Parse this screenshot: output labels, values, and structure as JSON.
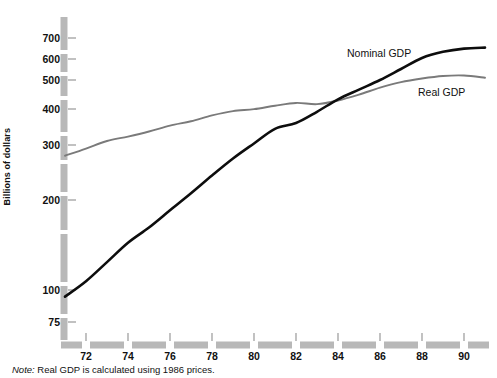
{
  "chart_data": {
    "type": "line",
    "title": "",
    "xlabel": "",
    "ylabel": "Billions of dollars",
    "note": "Note: Real GDP is calculated using 1986 prices.",
    "note_prefix": "Note:",
    "note_body": " Real GDP is calculated using 1986 prices.",
    "yscale": "log",
    "ylim": [
      75,
      760
    ],
    "xlim": [
      1971,
      1991
    ],
    "grid": false,
    "legend_position": "inline-annotation",
    "ytick_labels": [
      "700",
      "600",
      "500",
      "400",
      "300",
      "200",
      "100",
      "75"
    ],
    "ytick_values": [
      700,
      600,
      500,
      400,
      300,
      200,
      100,
      75
    ],
    "xtick_labels": [
      "72",
      "74",
      "76",
      "78",
      "80",
      "82",
      "84",
      "86",
      "88",
      "90"
    ],
    "xtick_values": [
      1972,
      1974,
      1976,
      1978,
      1980,
      1982,
      1984,
      1986,
      1988,
      1990
    ],
    "x": [
      1971,
      1972,
      1973,
      1974,
      1975,
      1976,
      1977,
      1978,
      1979,
      1980,
      1981,
      1982,
      1983,
      1984,
      1985,
      1986,
      1987,
      1988,
      1989,
      1990,
      1991
    ],
    "series": [
      {
        "name": "Nominal GDP",
        "color": "#0d0d0d",
        "width": 2.6,
        "values": [
          95,
          107,
          124,
          144,
          162,
          185,
          211,
          242,
          276,
          310,
          347,
          363,
          396,
          436,
          470,
          506,
          551,
          600,
          629,
          645,
          650
        ]
      },
      {
        "name": "Real GDP",
        "color": "#7a7a7a",
        "width": 1.9,
        "values": [
          282,
          298,
          316,
          327,
          340,
          356,
          368,
          385,
          398,
          404,
          415,
          424,
          420,
          432,
          452,
          477,
          498,
          512,
          522,
          524,
          515
        ]
      }
    ],
    "annotations": [
      {
        "text": "Nominal GDP",
        "x_px": 347,
        "y_px": 54
      },
      {
        "text": "Real GDP",
        "x_px": 418,
        "y_px": 93
      }
    ]
  },
  "axis_style": {
    "axis_color": "#b3b3b3",
    "tick_color": "#8c8c8c",
    "background": "#ffffff"
  }
}
